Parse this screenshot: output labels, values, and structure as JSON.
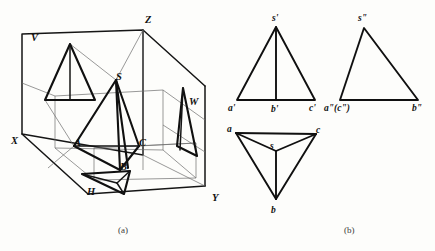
{
  "figure": {
    "captions": {
      "left": "(a)",
      "right": "(b)"
    },
    "colors": {
      "ink": "#101010",
      "light_ink": "#6d6d6d",
      "paper": "#fdfdfb"
    }
  },
  "pictorial": {
    "name": "three-plane-projection-box",
    "axes": [
      {
        "id": "axis-z",
        "label": "Z",
        "x": 145,
        "y": 23
      },
      {
        "id": "axis-x",
        "label": "X",
        "x": 11,
        "y": 144
      },
      {
        "id": "axis-y",
        "label": "Y",
        "x": 212,
        "y": 201
      }
    ],
    "planes": [
      {
        "id": "plane-v",
        "label": "V",
        "x": 31,
        "y": 41,
        "meaning": "frontal plane"
      },
      {
        "id": "plane-w",
        "label": "W",
        "x": 189,
        "y": 105,
        "meaning": "profile plane"
      },
      {
        "id": "plane-h",
        "label": "H",
        "x": 87,
        "y": 195,
        "meaning": "horizontal plane"
      }
    ],
    "solid_vertices": [
      {
        "id": "vertex-S",
        "label": "S",
        "x": 116,
        "y": 80,
        "role": "apex"
      },
      {
        "id": "vertex-A",
        "label": "A",
        "x": 74,
        "y": 146,
        "role": "base"
      },
      {
        "id": "vertex-B",
        "label": "B",
        "x": 120,
        "y": 170,
        "role": "base"
      },
      {
        "id": "vertex-C",
        "label": "C",
        "x": 139,
        "y": 146,
        "role": "base"
      }
    ]
  },
  "orthographic": {
    "front_view": {
      "name": "front-view-v-projection",
      "points": [
        {
          "id": "s-prime",
          "label": "s'",
          "x": 276,
          "y": 27,
          "lx": 273,
          "ly": 21
        },
        {
          "id": "a-prime",
          "label": "a'",
          "x": 237,
          "y": 100,
          "lx": 228,
          "ly": 111
        },
        {
          "id": "b-prime",
          "label": "b'",
          "x": 276,
          "y": 100,
          "lx": 271,
          "ly": 112
        },
        {
          "id": "c-prime",
          "label": "c'",
          "x": 315,
          "y": 100,
          "lx": 309,
          "ly": 111
        }
      ]
    },
    "side_view": {
      "name": "side-view-w-projection",
      "points": [
        {
          "id": "s-double-prime",
          "label": "s\"",
          "x": 364,
          "y": 28,
          "lx": 359,
          "ly": 21
        },
        {
          "id": "ac-double-prime",
          "label": "a\"(c\")",
          "x": 340,
          "y": 100,
          "lx": 326,
          "ly": 111
        },
        {
          "id": "b-double-prime",
          "label": "b\"",
          "x": 418,
          "y": 100,
          "lx": 413,
          "ly": 111
        }
      ]
    },
    "top_view": {
      "name": "top-view-h-projection",
      "points": [
        {
          "id": "a-point",
          "label": "a",
          "x": 236,
          "y": 133,
          "lx": 228,
          "ly": 130
        },
        {
          "id": "c-point",
          "label": "c",
          "x": 316,
          "y": 134,
          "lx": 317,
          "ly": 131
        },
        {
          "id": "b-point",
          "label": "b",
          "x": 276,
          "y": 199,
          "lx": 272,
          "ly": 212
        },
        {
          "id": "s-point",
          "label": "s",
          "x": 276,
          "y": 151,
          "lx": 272,
          "ly": 148
        }
      ]
    }
  }
}
